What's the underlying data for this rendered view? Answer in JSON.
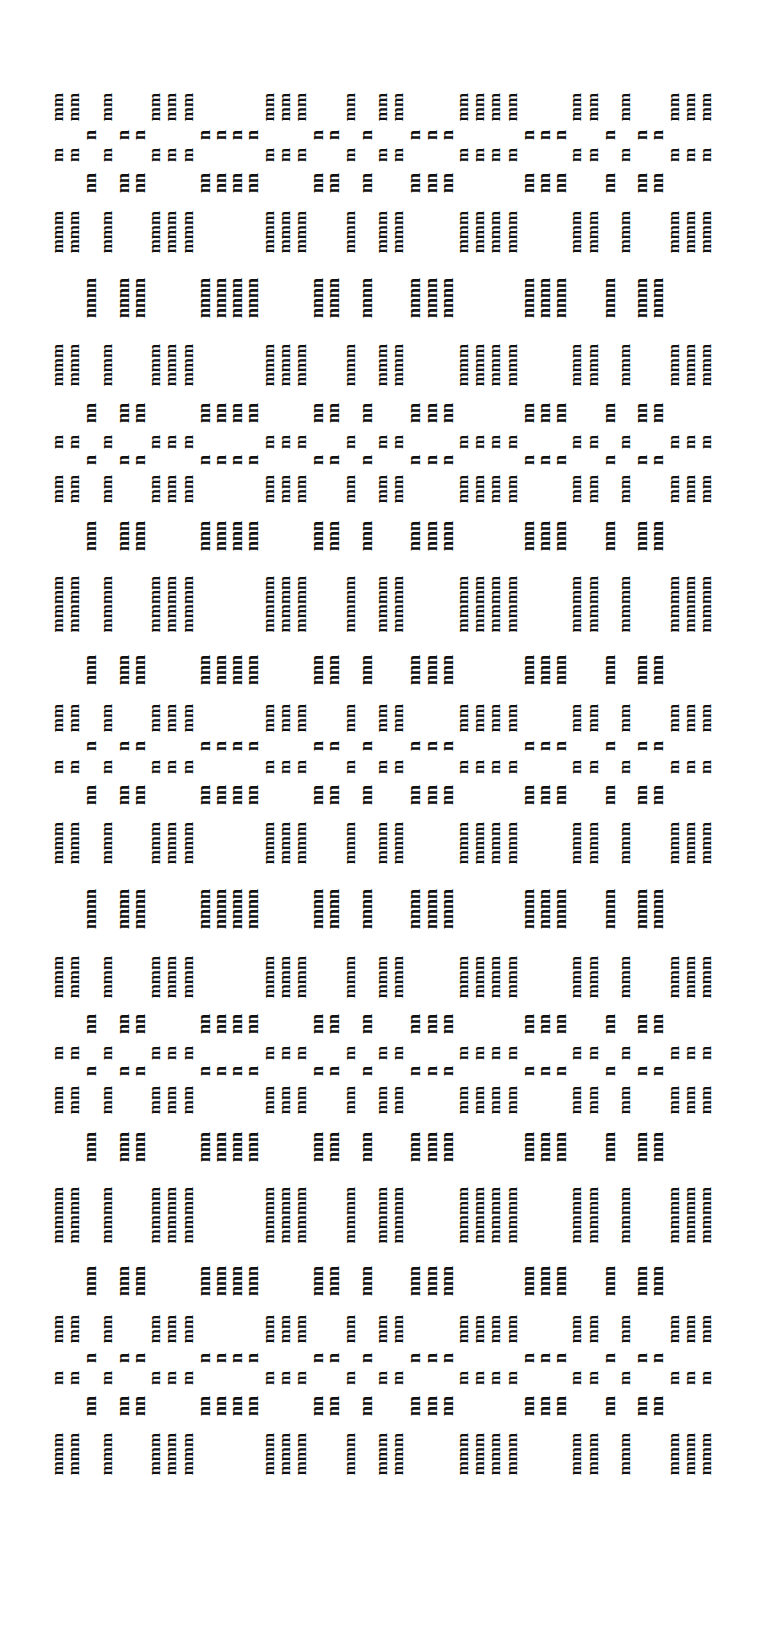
{
  "artwork": {
    "description": "Typewriter art weaving draft rotated 90 degrees, built from letters m and n",
    "ink_color": "#111111",
    "paper_color": "#ffffff",
    "m_char": "m",
    "n_char": "n",
    "origin": {
      "x": 50,
      "y": 88
    },
    "line_pitch_px": 16.2,
    "char_pitch_px": 19.1,
    "column_bands": [
      {
        "type": "m",
        "width": 2
      },
      {
        "type": "n",
        "width": 1
      },
      {
        "type": "m",
        "width": 1
      },
      {
        "type": "n",
        "width": 2
      },
      {
        "type": "m",
        "width": 3
      },
      {
        "type": "n",
        "width": 4
      },
      {
        "type": "m",
        "width": 3
      },
      {
        "type": "n",
        "width": 2
      },
      {
        "type": "m",
        "width": 1
      },
      {
        "type": "n",
        "width": 1
      },
      {
        "type": "m",
        "width": 2
      },
      {
        "type": "n",
        "width": 3
      },
      {
        "type": "m",
        "width": 4
      },
      {
        "type": "n",
        "width": 3
      },
      {
        "type": "m",
        "width": 2
      },
      {
        "type": "n",
        "width": 1
      },
      {
        "type": "m",
        "width": 1
      },
      {
        "type": "n",
        "width": 2
      },
      {
        "type": "m",
        "width": 3
      }
    ],
    "row_bands": [
      {
        "type": "m",
        "height": 2
      },
      {
        "type": "n",
        "height": 1
      },
      {
        "type": "m",
        "height": 1
      },
      {
        "type": "n",
        "height": 2
      },
      {
        "type": "m",
        "height": 3
      },
      {
        "type": "n",
        "height": 4
      },
      {
        "type": "m",
        "height": 3
      },
      {
        "type": "n",
        "height": 2
      },
      {
        "type": "m",
        "height": 1
      },
      {
        "type": "n",
        "height": 1
      },
      {
        "type": "m",
        "height": 2
      },
      {
        "type": "n",
        "height": 3
      },
      {
        "type": "m",
        "height": 4
      },
      {
        "type": "n",
        "height": 3
      },
      {
        "type": "m",
        "height": 2
      },
      {
        "type": "n",
        "height": 1
      },
      {
        "type": "m",
        "height": 1
      },
      {
        "type": "n",
        "height": 2
      },
      {
        "type": "m",
        "height": 3
      },
      {
        "type": "n",
        "height": 4
      },
      {
        "type": "m",
        "height": 3
      },
      {
        "type": "n",
        "height": 2
      },
      {
        "type": "m",
        "height": 1
      },
      {
        "type": "n",
        "height": 1
      },
      {
        "type": "m",
        "height": 2
      },
      {
        "type": "n",
        "height": 3
      },
      {
        "type": "m",
        "height": 4
      },
      {
        "type": "n",
        "height": 3
      },
      {
        "type": "m",
        "height": 2
      },
      {
        "type": "n",
        "height": 1
      },
      {
        "type": "m",
        "height": 1
      },
      {
        "type": "n",
        "height": 2
      },
      {
        "type": "m",
        "height": 3
      }
    ]
  }
}
